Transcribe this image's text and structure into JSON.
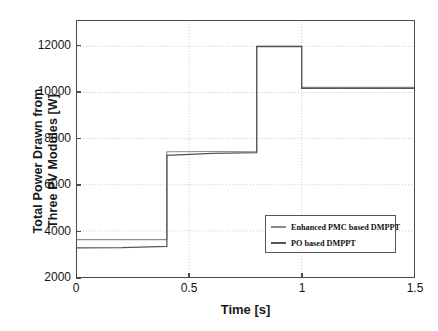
{
  "chart_data": {
    "type": "line",
    "title": "",
    "xlabel": "Time [s]",
    "ylabel_line1": "Total Power Drawn from",
    "ylabel_line2": "Three PV Modules [W]",
    "xlim": [
      0,
      1.5
    ],
    "ylim": [
      2000,
      13100
    ],
    "xticks": [
      0,
      0.5,
      1,
      1.5
    ],
    "xticklabels": [
      "0",
      "0.5",
      "1",
      "1.5"
    ],
    "yticks": [
      2000,
      4000,
      6000,
      8000,
      10000,
      12000
    ],
    "yticklabels": [
      "2000",
      "4000",
      "6000",
      "8000",
      "10000",
      "12000"
    ],
    "grid": true,
    "grid_style": "dotted",
    "legend_position": "lower right",
    "series": [
      {
        "name": "Enhanced PMC based DMPPT",
        "color": "#8c8c8c",
        "points": [
          [
            0.0,
            3620
          ],
          [
            0.4,
            3620
          ],
          [
            0.4,
            7430
          ],
          [
            0.8,
            7450
          ],
          [
            0.8,
            12010
          ],
          [
            1.0,
            12010
          ],
          [
            1.0,
            10220
          ],
          [
            1.5,
            10220
          ]
        ]
      },
      {
        "name": "PO based DMPPT",
        "color": "#555555",
        "points": [
          [
            0.0,
            3260
          ],
          [
            0.2,
            3270
          ],
          [
            0.4,
            3330
          ],
          [
            0.4,
            7270
          ],
          [
            0.6,
            7360
          ],
          [
            0.8,
            7390
          ],
          [
            0.8,
            11990
          ],
          [
            1.0,
            11990
          ],
          [
            1.0,
            10180
          ],
          [
            1.5,
            10180
          ]
        ]
      }
    ],
    "step_times": [
      0.4,
      0.8,
      1.0
    ],
    "annotations": []
  },
  "legend": {
    "items": [
      {
        "label": "Enhanced PMC based DMPPT",
        "color": "#8c8c8c"
      },
      {
        "label": "PO based DMPPT",
        "color": "#555555"
      }
    ]
  },
  "colors": {
    "axis": "#4a4a4a",
    "grid": "#b8b8b8",
    "text": "#141414",
    "background": "#ffffff"
  }
}
